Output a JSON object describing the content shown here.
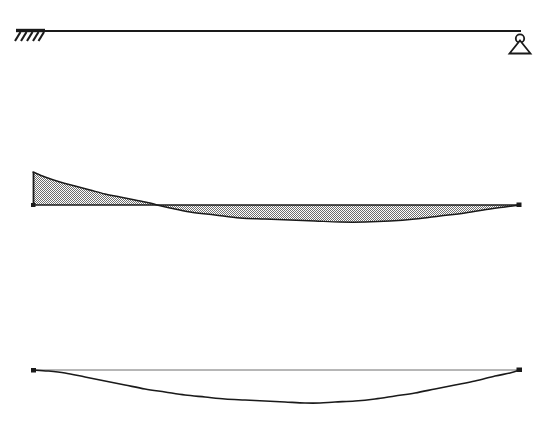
{
  "figure": {
    "type": "structural-analysis-diagram",
    "width": 543,
    "height": 426,
    "background_color": "#ffffff",
    "ink_color": "#1a1a1a",
    "fill_color": "#9a9a9a",
    "fill_pattern": "checkered-dither-50",
    "panels": [
      {
        "name": "structure-panel",
        "label": "Beam structure",
        "baseline_y": 31,
        "span_start_x": 33,
        "span_end_x": 520
      },
      {
        "name": "moment-panel",
        "label": "Bending moment diagram",
        "baseline_y": 205,
        "span_start_x": 33,
        "span_end_x": 520
      },
      {
        "name": "deflection-panel",
        "label": "Deflected shape",
        "baseline_y": 370,
        "span_start_x": 33,
        "span_end_x": 520
      }
    ],
    "supports": [
      {
        "name": "fixed-support",
        "symbol": "hatched-ground",
        "position_x": 33,
        "position_y": 31,
        "hatch_strokes": 5,
        "bar_width": 30
      },
      {
        "name": "pin-support",
        "symbol": "circle-on-triangle",
        "position_x": 520,
        "position_y": 31,
        "circle_radius": 4.2,
        "triangle_width": 20,
        "triangle_height": 13
      }
    ]
  },
  "chart_data": {
    "type": "area",
    "xlabel": "",
    "ylabel": "",
    "grid": false,
    "legend": "none",
    "baseline_value": 0,
    "xlim": [
      33,
      520
    ],
    "sign_convention": "hogging above baseline, sagging below baseline",
    "zero_crossing_x": 157,
    "moment_curve": {
      "name": "Bending moment M(x)",
      "units": "px-relative",
      "points": [
        {
          "x": 33,
          "y": 172
        },
        {
          "x": 33,
          "y": 205
        },
        {
          "x": 45,
          "y": 177
        },
        {
          "x": 60,
          "y": 182
        },
        {
          "x": 75,
          "y": 186
        },
        {
          "x": 90,
          "y": 190
        },
        {
          "x": 105,
          "y": 194
        },
        {
          "x": 120,
          "y": 197
        },
        {
          "x": 135,
          "y": 200
        },
        {
          "x": 150,
          "y": 203
        },
        {
          "x": 157,
          "y": 205
        },
        {
          "x": 170,
          "y": 208
        },
        {
          "x": 190,
          "y": 212
        },
        {
          "x": 215,
          "y": 215
        },
        {
          "x": 240,
          "y": 218
        },
        {
          "x": 265,
          "y": 219
        },
        {
          "x": 290,
          "y": 220
        },
        {
          "x": 315,
          "y": 221
        },
        {
          "x": 340,
          "y": 222
        },
        {
          "x": 365,
          "y": 222
        },
        {
          "x": 390,
          "y": 221
        },
        {
          "x": 415,
          "y": 219
        },
        {
          "x": 440,
          "y": 216
        },
        {
          "x": 465,
          "y": 213
        },
        {
          "x": 490,
          "y": 209
        },
        {
          "x": 505,
          "y": 207
        },
        {
          "x": 520,
          "y": 205
        }
      ],
      "peak_hogging": {
        "x": 33,
        "y": 172,
        "description": "maximum hogging moment at fixed support"
      },
      "peak_sagging": {
        "x": 352,
        "y": 222,
        "description": "maximum sagging moment near mid-right span"
      }
    },
    "deflection_curve": {
      "name": "Deflected shape v(x)",
      "units": "px-relative",
      "reference_line_y": 370,
      "points": [
        {
          "x": 33,
          "y": 370
        },
        {
          "x": 48,
          "y": 371
        },
        {
          "x": 65,
          "y": 373
        },
        {
          "x": 85,
          "y": 377
        },
        {
          "x": 105,
          "y": 381
        },
        {
          "x": 125,
          "y": 385
        },
        {
          "x": 145,
          "y": 389
        },
        {
          "x": 165,
          "y": 392
        },
        {
          "x": 185,
          "y": 395
        },
        {
          "x": 205,
          "y": 397
        },
        {
          "x": 225,
          "y": 399
        },
        {
          "x": 245,
          "y": 400
        },
        {
          "x": 265,
          "y": 401
        },
        {
          "x": 285,
          "y": 402
        },
        {
          "x": 305,
          "y": 403
        },
        {
          "x": 320,
          "y": 403
        },
        {
          "x": 335,
          "y": 402
        },
        {
          "x": 355,
          "y": 401
        },
        {
          "x": 375,
          "y": 399
        },
        {
          "x": 395,
          "y": 396
        },
        {
          "x": 415,
          "y": 393
        },
        {
          "x": 435,
          "y": 389
        },
        {
          "x": 455,
          "y": 385
        },
        {
          "x": 475,
          "y": 381
        },
        {
          "x": 495,
          "y": 376
        },
        {
          "x": 510,
          "y": 373
        },
        {
          "x": 520,
          "y": 370
        }
      ],
      "max_deflection": {
        "x": 320,
        "y": 403,
        "description": "maximum sag near mid-right span"
      },
      "end_markers": [
        {
          "name": "left-node-marker",
          "x": 33,
          "y": 370
        },
        {
          "name": "right-node-marker",
          "x": 520,
          "y": 370
        }
      ]
    }
  }
}
